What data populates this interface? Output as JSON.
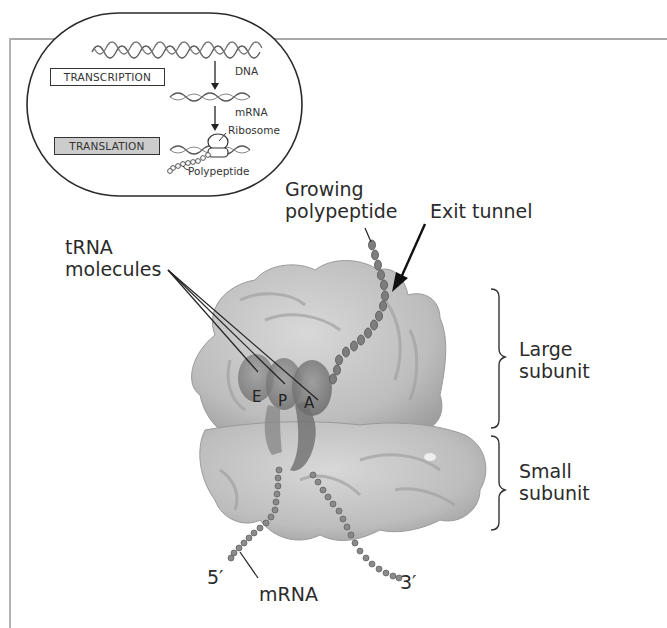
{
  "inset": {
    "steps": [
      {
        "label": "TRANSCRIPTION",
        "highlighted": false
      },
      {
        "label": "TRANSLATION",
        "highlighted": true
      }
    ],
    "labels": {
      "dna": "DNA",
      "mrna": "mRNA",
      "ribosome": "Ribosome",
      "polypeptide": "Polypeptide"
    }
  },
  "main": {
    "growing_polypeptide": [
      "Growing",
      "polypeptide"
    ],
    "exit_tunnel": "Exit tunnel",
    "trna_molecules": [
      "tRNA",
      "molecules"
    ],
    "sites": [
      "E",
      "P",
      "A"
    ],
    "large_subunit": [
      "Large",
      "subunit"
    ],
    "small_subunit": [
      "Small",
      "subunit"
    ],
    "five_prime": "5′",
    "three_prime": "3′",
    "mrna": "mRNA"
  },
  "colors": {
    "ribosome_fill": "#c9c9c9",
    "ribosome_shade": "#a8a8a8",
    "trna_fill": "#8a8a8a",
    "bead": "#7a7a7a",
    "frame": "#aaaaaa",
    "translation_box": "#cccccc"
  }
}
